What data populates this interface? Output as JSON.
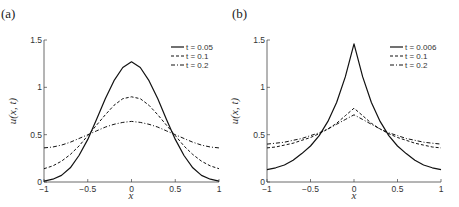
{
  "chart_data": [
    {
      "type": "line",
      "panel_label": "(a)",
      "title": "",
      "xlabel": "x",
      "ylabel": "u(x, t)",
      "xlim": [
        -1,
        1
      ],
      "ylim": [
        0,
        1.5
      ],
      "xticks": [
        "-1",
        "-0.5",
        "0",
        "0.5",
        "1"
      ],
      "yticks": [
        "0",
        "0.5",
        "1",
        "1.5"
      ],
      "grid": false,
      "legend_position": "upper right",
      "x": [
        -1,
        -0.9,
        -0.8,
        -0.7,
        -0.6,
        -0.5,
        -0.4,
        -0.3,
        -0.2,
        -0.1,
        0,
        0.1,
        0.2,
        0.3,
        0.4,
        0.5,
        0.6,
        0.7,
        0.8,
        0.9,
        1
      ],
      "series": [
        {
          "name": "t = 0.05",
          "style": "solid",
          "values": [
            0.01,
            0.03,
            0.07,
            0.15,
            0.28,
            0.45,
            0.66,
            0.88,
            1.07,
            1.21,
            1.27,
            1.21,
            1.07,
            0.88,
            0.66,
            0.45,
            0.28,
            0.15,
            0.07,
            0.03,
            0.01
          ]
        },
        {
          "name": "t = 0.1",
          "style": "dashed",
          "values": [
            0.14,
            0.17,
            0.22,
            0.29,
            0.38,
            0.49,
            0.6,
            0.71,
            0.81,
            0.88,
            0.9,
            0.88,
            0.81,
            0.71,
            0.6,
            0.49,
            0.38,
            0.29,
            0.22,
            0.17,
            0.14
          ]
        },
        {
          "name": "t = 0.2",
          "style": "dashdot",
          "values": [
            0.36,
            0.37,
            0.39,
            0.42,
            0.46,
            0.5,
            0.54,
            0.58,
            0.61,
            0.63,
            0.64,
            0.63,
            0.61,
            0.58,
            0.54,
            0.5,
            0.46,
            0.42,
            0.39,
            0.37,
            0.36
          ]
        }
      ]
    },
    {
      "type": "line",
      "panel_label": "(b)",
      "title": "",
      "xlabel": "x",
      "ylabel": "u(x, t)",
      "xlim": [
        -1,
        1
      ],
      "ylim": [
        0,
        1.5
      ],
      "xticks": [
        "-1",
        "-0.5",
        "0",
        "0.5",
        "1"
      ],
      "yticks": [
        "0",
        "0.5",
        "1",
        "1.5"
      ],
      "grid": false,
      "legend_position": "upper right",
      "x": [
        -1,
        -0.9,
        -0.8,
        -0.7,
        -0.6,
        -0.5,
        -0.4,
        -0.3,
        -0.2,
        -0.1,
        0,
        0.1,
        0.2,
        0.3,
        0.4,
        0.5,
        0.6,
        0.7,
        0.8,
        0.9,
        1
      ],
      "series": [
        {
          "name": "t = 0.006",
          "style": "solid",
          "values": [
            0.13,
            0.15,
            0.18,
            0.23,
            0.3,
            0.38,
            0.49,
            0.64,
            0.84,
            1.11,
            1.46,
            1.11,
            0.84,
            0.64,
            0.49,
            0.38,
            0.3,
            0.23,
            0.18,
            0.15,
            0.13
          ]
        },
        {
          "name": "t = 0.1",
          "style": "dashed",
          "values": [
            0.36,
            0.37,
            0.39,
            0.41,
            0.44,
            0.47,
            0.51,
            0.56,
            0.62,
            0.7,
            0.78,
            0.7,
            0.62,
            0.56,
            0.51,
            0.47,
            0.44,
            0.41,
            0.39,
            0.37,
            0.36
          ]
        },
        {
          "name": "t = 0.2",
          "style": "dashdot",
          "values": [
            0.4,
            0.41,
            0.42,
            0.44,
            0.46,
            0.49,
            0.52,
            0.56,
            0.61,
            0.66,
            0.71,
            0.66,
            0.61,
            0.56,
            0.52,
            0.49,
            0.46,
            0.44,
            0.42,
            0.41,
            0.4
          ]
        }
      ]
    }
  ],
  "panels": [
    {
      "label": "(a)",
      "legend": [
        "t = 0.05",
        "t = 0.1",
        "t = 0.2"
      ]
    },
    {
      "label": "(b)",
      "legend": [
        "t = 0.006",
        "t = 0.1",
        "t = 0.2"
      ]
    }
  ],
  "axes": {
    "xlabel": "x",
    "ylabel": "u(x, t)",
    "xticks": [
      "−1",
      "−0.5",
      "0",
      "0.5",
      "1"
    ],
    "yticks": [
      "0",
      "0.5",
      "1",
      "1.5"
    ]
  }
}
